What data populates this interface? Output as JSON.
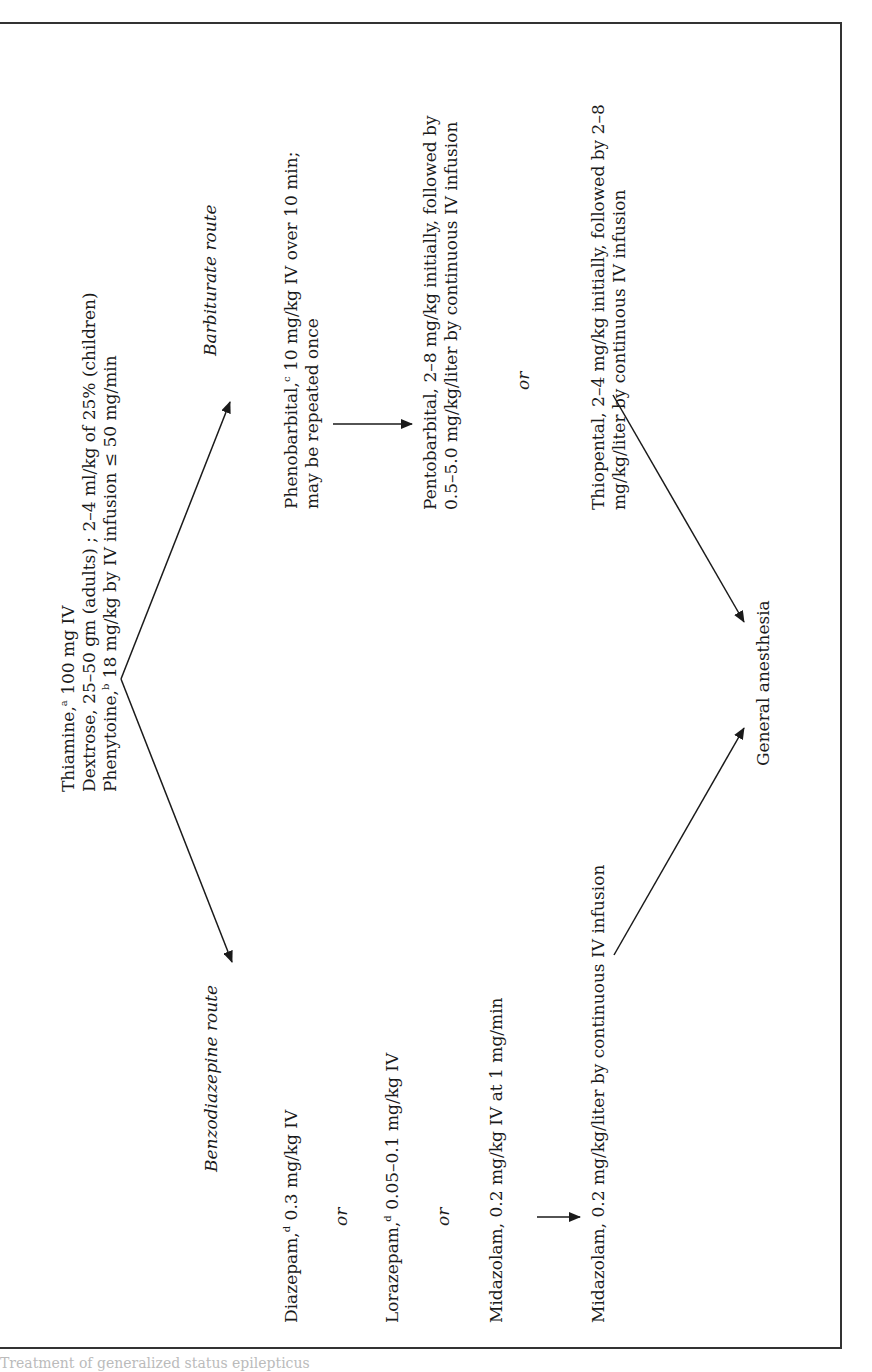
{
  "figure": {
    "orientation": "rotated -90deg (landscape page)",
    "start_box": {
      "lines": [
        {
          "drug": "Thiamine,",
          "sup": "a",
          "text": " 100 mg IV"
        },
        {
          "drug": "Dextrose, 25–50 gm (adults) ; 2–4 ml/kg of 25% (children)",
          "sup": "",
          "text": ""
        },
        {
          "drug": "Phenytoine,",
          "sup": "b",
          "text": " 18 mg/kg by IV infusion ≤ 50 mg/min"
        }
      ]
    },
    "barbiturate_route": {
      "heading": "Barbiturate route",
      "step1": {
        "drug": "Phenobarbital,",
        "sup": "c",
        "line1": " 10 mg/kg IV over 10 min;",
        "line2": "may be repeated once"
      },
      "option_a": {
        "line1": "Pentobarbital, 2–8 mg/kg initially, followed by",
        "line2": "0.5–5.0 mg/kg/liter by continuous IV infusion"
      },
      "or_label": "or",
      "option_b": {
        "line1": "Thiopental, 2–4 mg/kg initially, followed by 2–8",
        "line2": "mg/kg/liter by continuous IV infusion"
      }
    },
    "benzodiazepine_route": {
      "heading": "Benzodiazepine route",
      "option_1": {
        "drug": "Diazepam,",
        "sup": "d",
        "text": " 0.3 mg/kg IV"
      },
      "or_label_1": "or",
      "option_2": {
        "drug": "Lorazepam,",
        "sup": "d",
        "text": " 0.05–0.1 mg/kg IV"
      },
      "or_label_2": "or",
      "option_3": {
        "text": "Midazolam, 0.2 mg/kg IV at 1 mg/min"
      },
      "maintenance": {
        "text": "Midazolam, 0.2 mg/kg/liter by continuous IV infusion"
      }
    },
    "end_node": {
      "text": "General anesthesia"
    },
    "caption_fragment": "Treatment of generalized status epilepticus"
  },
  "colors": {
    "ink": "#1a1a1a",
    "border": "#333333",
    "background": "#ffffff"
  }
}
